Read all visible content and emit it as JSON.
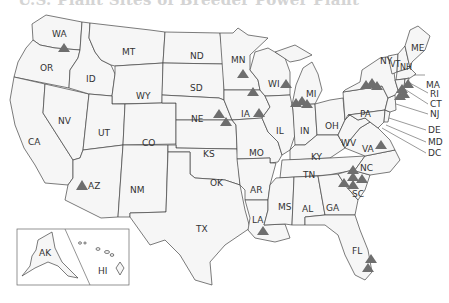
{
  "title": "U.S. Plant Sites of Breeder Power Plant",
  "title_note": "title partially cropped at top edge",
  "marker_color": "#6e6e6e",
  "state_fill": "#f6f6f6",
  "state_stroke": "#444444",
  "states": {
    "WA": "WA",
    "OR": "OR",
    "CA": "CA",
    "NV": "NV",
    "ID": "ID",
    "MT": "MT",
    "WY": "WY",
    "UT": "UT",
    "AZ": "AZ",
    "CO": "CO",
    "NM": "NM",
    "ND": "ND",
    "SD": "SD",
    "NE": "NE",
    "KS": "KS",
    "OK": "OK",
    "TX": "TX",
    "MN": "MN",
    "IA": "IA",
    "MO": "MO",
    "AR": "AR",
    "LA": "LA",
    "WI": "WI",
    "IL": "IL",
    "MI": "MI",
    "IN": "IN",
    "OH": "OH",
    "KY": "KY",
    "TN": "TN",
    "MS": "MS",
    "AL": "AL",
    "GA": "GA",
    "FL": "FL",
    "SC": "SC",
    "NC": "NC",
    "VA": "VA",
    "WV": "WV",
    "PA": "PA",
    "NY": "NY",
    "VT": "VT",
    "NH": "NH",
    "ME": "ME",
    "MA": "MA",
    "RI": "RI",
    "CT": "CT",
    "NJ": "NJ",
    "DE": "DE",
    "MD": "MD",
    "DC": "DC",
    "AK": "AK",
    "HI": "HI"
  },
  "plant_markers": [
    {
      "state": "WA",
      "count": 1
    },
    {
      "state": "AZ",
      "count": 1
    },
    {
      "state": "NE",
      "count": 2
    },
    {
      "state": "MN",
      "count": 2
    },
    {
      "state": "IA",
      "count": 1
    },
    {
      "state": "WI",
      "count": 1
    },
    {
      "state": "MI",
      "count": 3
    },
    {
      "state": "NY",
      "count": 3
    },
    {
      "state": "NH",
      "count": 1
    },
    {
      "state": "MA",
      "count": 1
    },
    {
      "state": "CT",
      "count": 2
    },
    {
      "state": "VA",
      "count": 1
    },
    {
      "state": "NC",
      "count": 3
    },
    {
      "state": "SC",
      "count": 3
    },
    {
      "state": "LA",
      "count": 1
    },
    {
      "state": "FL",
      "count": 2
    }
  ],
  "inset_labels": {
    "alaska": "AK",
    "hawaii": "HI"
  }
}
